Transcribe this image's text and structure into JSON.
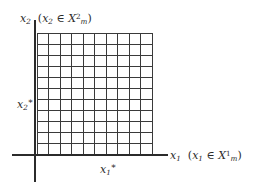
{
  "figure": {
    "type": "math-diagram",
    "background_color": "#ffffff",
    "ink_color": "#2b2b2b",
    "grid_line_color": "#3a3a3a",
    "axis_color": "#2b2b2b"
  },
  "axes": {
    "x": {
      "name": "x1",
      "label_var": "x",
      "label_sub": "1",
      "paren_open": "(",
      "member_var": "x",
      "member_sub": "1",
      "member_symbol": "∈",
      "set_var": "X",
      "set_sup": "1",
      "set_sub": "m",
      "paren_close": ")",
      "full_text": "x₁ (x₁ ∈ X¹ₘ)"
    },
    "y": {
      "name": "x2",
      "label_var": "x",
      "label_sub": "2",
      "paren_open": "(",
      "member_var": "x",
      "member_sub": "2",
      "member_symbol": "∈",
      "set_var": "X",
      "set_sup": "2",
      "set_sub": "m",
      "paren_close": ")",
      "full_text": "x₂ (x₂ ∈ X²ₘ)"
    }
  },
  "ticks": {
    "x_star": {
      "var": "x",
      "sub": "1",
      "star": "*",
      "full_text": "x₁*"
    },
    "y_star": {
      "var": "x",
      "sub": "2",
      "star": "*",
      "full_text": "x₂*"
    }
  },
  "chart_data": {
    "type": "scatter",
    "title": "",
    "xlabel": "x₁ (x₁ ∈ X¹ₘ)",
    "ylabel": "x₂ (x₂ ∈ X²ₘ)",
    "grid": true,
    "legend": "none",
    "grid_columns": 10,
    "grid_rows": 11,
    "xlim": [
      0,
      10
    ],
    "ylim": [
      0,
      11
    ],
    "x_tick_labels": [
      "x₁*"
    ],
    "x_tick_values": [
      5
    ],
    "y_tick_labels": [
      "x₂*"
    ],
    "y_tick_values": [
      5
    ],
    "series": [
      {
        "name": "grid-region",
        "values": []
      }
    ],
    "annotations": [
      {
        "text": "x₁*",
        "x": 5,
        "y": 0,
        "position": "below-axis"
      },
      {
        "text": "x₂*",
        "x": 0,
        "y": 5,
        "position": "left-of-axis"
      }
    ]
  },
  "geometry": {
    "grid_left": 37,
    "grid_right": 152,
    "grid_top": 33,
    "grid_bottom": 155,
    "axis_x_y": 155,
    "axis_y_x": 35,
    "axis_x_start": 12,
    "axis_x_end": 168,
    "axis_y_start": 20,
    "axis_y_end": 182,
    "columns": 10,
    "rows": 11
  }
}
